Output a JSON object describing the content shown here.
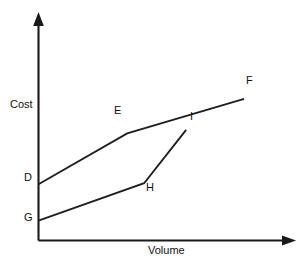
{
  "chart_data": {
    "type": "line",
    "title": "",
    "xlabel": "Volume",
    "ylabel": "Cost",
    "grid": false,
    "legend": "none",
    "axes": {
      "x_arrow": true,
      "y_arrow": true,
      "x_ticks": [],
      "y_ticks": [],
      "xlim": [
        0,
        100
      ],
      "ylim": [
        0,
        100
      ]
    },
    "annotations": [
      {
        "label": "D",
        "x": 0,
        "y": 27.4
      },
      {
        "label": "E",
        "x": 34.6,
        "y": 52.2
      },
      {
        "label": "F",
        "x": 80.2,
        "y": 69.0
      },
      {
        "label": "G",
        "x": 0,
        "y": 9.7
      },
      {
        "label": "H",
        "x": 41.2,
        "y": 27.9
      },
      {
        "label": "I",
        "x": 57.6,
        "y": 53.9
      }
    ],
    "series": [
      {
        "name": "Upper cost curve",
        "points": [
          {
            "label": "D",
            "x": 0,
            "y": 27.4
          },
          {
            "label": "E",
            "x": 34.6,
            "y": 52.2
          },
          {
            "label": "F",
            "x": 80.2,
            "y": 69.0
          }
        ]
      },
      {
        "name": "Lower cost curve",
        "points": [
          {
            "label": "G",
            "x": 0,
            "y": 9.7
          },
          {
            "label": "H",
            "x": 41.2,
            "y": 27.9
          },
          {
            "label": "I",
            "x": 57.6,
            "y": 53.9
          }
        ]
      }
    ],
    "colors": {
      "axis": "#1a1a1a",
      "line": "#1f1f1f",
      "background": "#ffffff",
      "text": "#111111"
    }
  },
  "labels": {
    "y_axis_title": "Cost",
    "x_axis_title": "Volume",
    "point_d": "D",
    "point_e": "E",
    "point_f": "F",
    "point_g": "G",
    "point_h": "H",
    "point_i": "I"
  }
}
